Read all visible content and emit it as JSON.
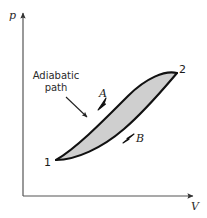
{
  "figure": {
    "type": "pressure-volume-diagram",
    "axes": {
      "y_label": "p",
      "x_label": "V",
      "origin_px": [
        23,
        196
      ],
      "y_axis_top_px": [
        23,
        10
      ],
      "x_axis_right_px": [
        196,
        196
      ]
    },
    "annotation": {
      "line1": "Adiabatic",
      "line2": "path",
      "leader_from_px": [
        66,
        98
      ],
      "leader_to_px": [
        89,
        119
      ]
    },
    "states": [
      {
        "id": "1",
        "label": "1",
        "point_px": [
          56,
          160
        ]
      },
      {
        "id": "2",
        "label": "2",
        "point_px": [
          177,
          73
        ]
      }
    ],
    "paths": [
      {
        "id": "A",
        "label": "A",
        "description": "upper curve from state 1 to state 2",
        "direction": "1-to-2",
        "arrow_at_px": [
          103,
          103
        ]
      },
      {
        "id": "B",
        "label": "B",
        "description": "lower curve from state 1 to state 2",
        "direction": "1-to-2",
        "arrow_at_px": [
          131,
          137
        ]
      }
    ],
    "colors": {
      "fill": "#cfcfcf",
      "curve_stroke": "#111111",
      "axis_stroke": "#555555",
      "text": "#1a1a1a"
    }
  }
}
